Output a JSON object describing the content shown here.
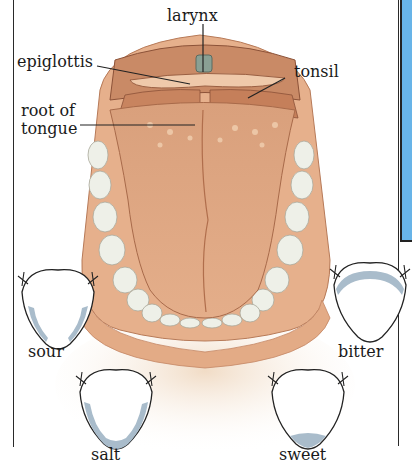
{
  "diagram": {
    "anatomy_labels": {
      "larynx": "larynx",
      "epiglottis": "epiglottis",
      "tonsil": "tonsil",
      "root_of_tongue_line1": "root of",
      "root_of_tongue_line2": "tongue"
    },
    "taste_zones": [
      {
        "name": "sour",
        "label": "sour",
        "region": "sides"
      },
      {
        "name": "salt",
        "label": "salt",
        "region": "sides and tip"
      },
      {
        "name": "bitter",
        "label": "bitter",
        "region": "back"
      },
      {
        "name": "sweet",
        "label": "sweet",
        "region": "tip"
      }
    ],
    "colors": {
      "tongue_flesh": "#d9a07c",
      "tongue_dark": "#b66f4c",
      "gum": "#e8b896",
      "teeth": "#eef0e8",
      "taste_zone": "#a9bccb",
      "side_panel": "#68b4e8",
      "line": "#222222"
    }
  }
}
